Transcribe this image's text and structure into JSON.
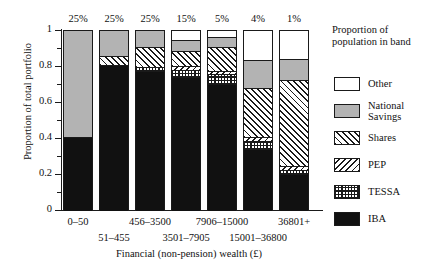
{
  "chart_data": {
    "type": "bar",
    "subtype": "stacked-bar-100",
    "title": "",
    "xlabel": "Financial (non-pension) wealth (£)",
    "ylabel": "Proportion of total portfolio",
    "ylim": [
      0,
      1
    ],
    "ytick_labels": [
      "0",
      "0.2",
      "0.4",
      "0.6",
      "0.8",
      "1"
    ],
    "ytick_values": [
      0,
      0.2,
      0.4,
      0.6,
      0.8,
      1
    ],
    "grid": false,
    "legend_position": "right",
    "legend_title": "Proportion of\npopulation in band",
    "categories": [
      "0–50",
      "51–455",
      "456–3500",
      "3501–7905",
      "7906–15000",
      "15001–36800",
      "36801+"
    ],
    "population_share_labels": [
      "25%",
      "25%",
      "25%",
      "15%",
      "5%",
      "4%",
      "1%"
    ],
    "population_share_values": [
      25,
      25,
      25,
      15,
      5,
      4,
      1
    ],
    "series": [
      {
        "name": "IBA",
        "pattern": "solid-black",
        "values": [
          0.41,
          0.81,
          0.775,
          0.745,
          0.705,
          0.345,
          0.205
        ]
      },
      {
        "name": "TESSA",
        "pattern": "checkerboard",
        "values": [
          0.0,
          0.0,
          0.025,
          0.04,
          0.055,
          0.045,
          0.025
        ]
      },
      {
        "name": "PEP",
        "pattern": "back-hatch",
        "values": [
          0.0,
          0.0,
          0.0,
          0.02,
          0.02,
          0.02,
          0.02
        ]
      },
      {
        "name": "Shares",
        "pattern": "fwd-hatch",
        "values": [
          0.0,
          0.05,
          0.11,
          0.085,
          0.13,
          0.275,
          0.48
        ]
      },
      {
        "name": "National Savings",
        "pattern": "solid-grey",
        "values": [
          0.59,
          0.14,
          0.09,
          0.06,
          0.055,
          0.155,
          0.115
        ]
      },
      {
        "name": "Other",
        "pattern": "white",
        "values": [
          0.0,
          0.0,
          0.0,
          0.05,
          0.035,
          0.16,
          0.155
        ]
      }
    ]
  },
  "legend": {
    "title_line1": "Proportion of",
    "title_line2": "population in band",
    "items": [
      {
        "label": "Other",
        "pattern": "white"
      },
      {
        "label": "National\nSavings",
        "pattern": "solid-grey"
      },
      {
        "label": "Shares",
        "pattern": "fwd-hatch"
      },
      {
        "label": "PEP",
        "pattern": "back-hatch"
      },
      {
        "label": "TESSA",
        "pattern": "checkerboard"
      },
      {
        "label": "IBA",
        "pattern": "solid-black"
      }
    ]
  },
  "axes": {
    "y_label": "Proportion of total portfolio",
    "x_label": "Financial (non-pension) wealth (£)",
    "y_ticks": [
      "1",
      "0.8",
      "0.6",
      "0.4",
      "0.2",
      "0"
    ]
  }
}
